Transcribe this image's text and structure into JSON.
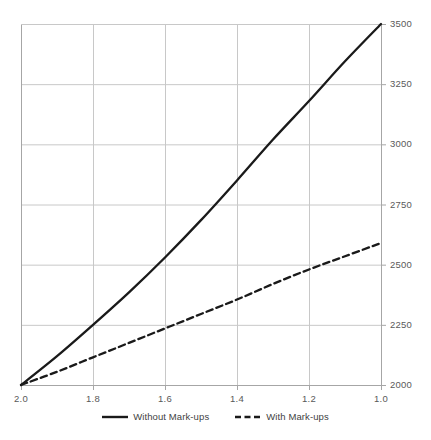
{
  "chart_data": {
    "type": "line",
    "title": "",
    "subtitle": "",
    "xlabel": "",
    "ylabel": "",
    "xlim": [
      2.0,
      1.0
    ],
    "ylim": [
      2000,
      3500
    ],
    "x_reversed": true,
    "grid": true,
    "legend_position": "bottom",
    "x_ticks": [
      "2.0",
      "1.8",
      "1.6",
      "1.4",
      "1.2",
      "1.0"
    ],
    "x_tick_values": [
      2.0,
      1.8,
      1.6,
      1.4,
      1.2,
      1.0
    ],
    "y_ticks": [
      "2000",
      "2250",
      "2500",
      "2750",
      "3000",
      "3250",
      "3500"
    ],
    "y_tick_values": [
      2000,
      2250,
      2500,
      2750,
      3000,
      3250,
      3500
    ],
    "y_axis_side": "right",
    "x": [
      2.0,
      1.9,
      1.8,
      1.7,
      1.6,
      1.5,
      1.4,
      1.3,
      1.2,
      1.1,
      1.0
    ],
    "series": [
      {
        "name": "Without Mark-ups",
        "style": "solid",
        "color": "#1a1a1a",
        "values": [
          2000,
          2120,
          2250,
          2385,
          2530,
          2685,
          2850,
          3020,
          3180,
          3345,
          3500
        ]
      },
      {
        "name": "With Mark-ups",
        "style": "dashed",
        "color": "#1a1a1a",
        "values": [
          2000,
          2055,
          2115,
          2175,
          2235,
          2295,
          2355,
          2420,
          2480,
          2535,
          2590
        ]
      }
    ],
    "colors": {
      "grid": "#c8c8c8",
      "axis": "#a6a6a6",
      "line": "#1a1a1a",
      "tick_text": "#595959",
      "legend_text": "#3f3f3f",
      "background": "#ffffff"
    },
    "legend": [
      {
        "label": "Without Mark-ups",
        "style": "solid"
      },
      {
        "label": "With Mark-ups",
        "style": "dashed"
      }
    ]
  }
}
